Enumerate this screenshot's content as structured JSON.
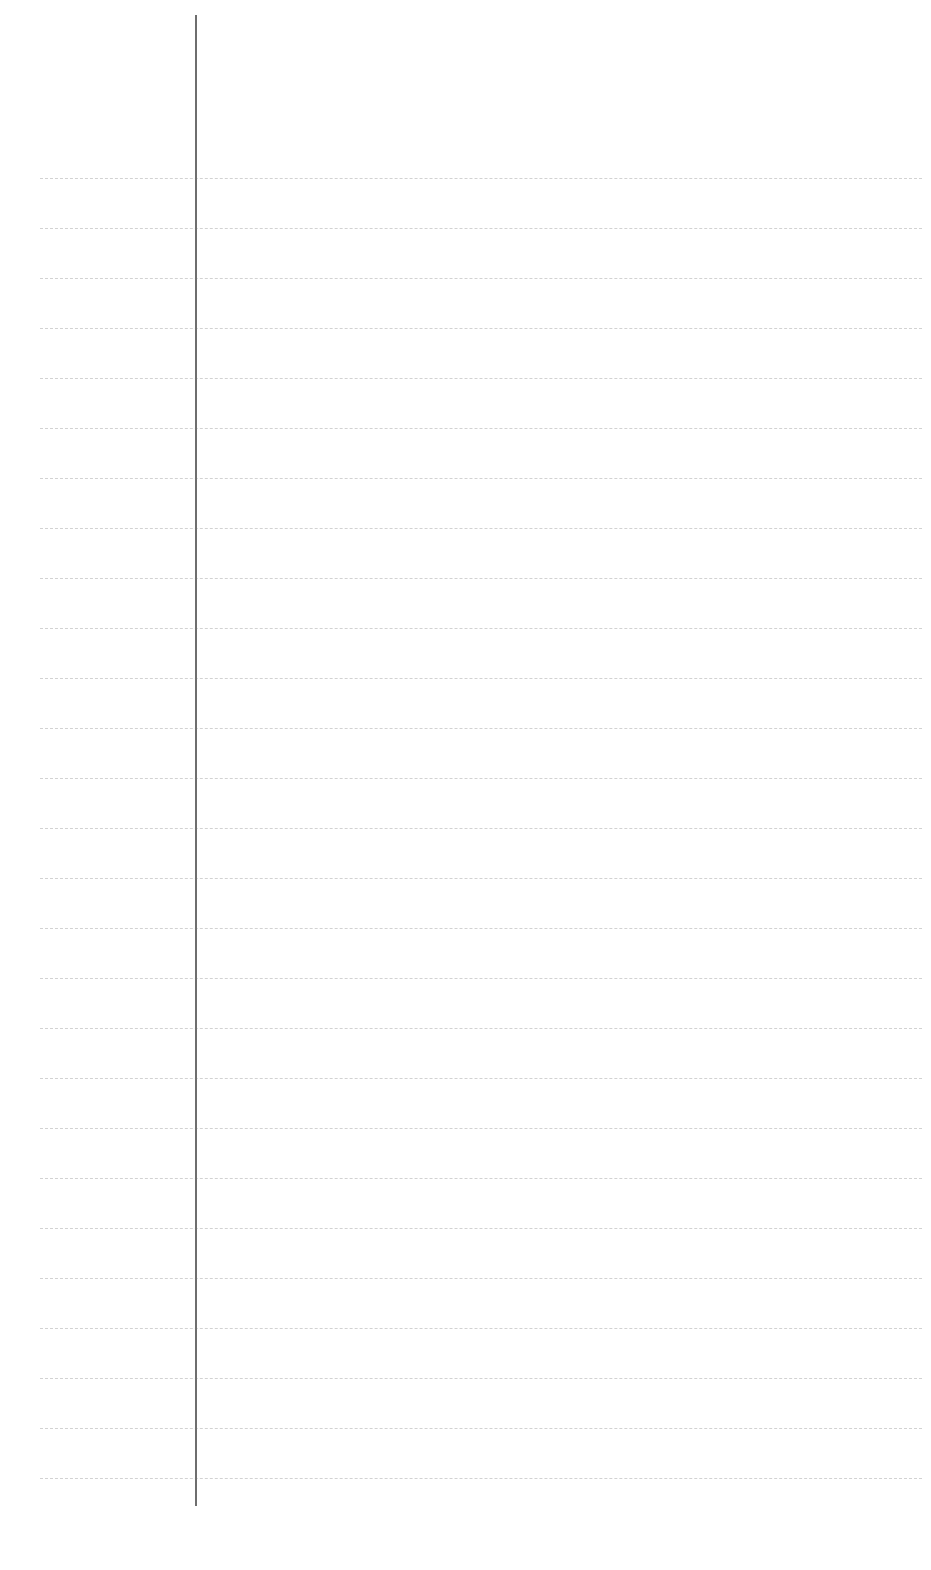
{
  "page": {
    "type": "ruled-paper",
    "background_color": "#ffffff",
    "rule_color": "#d2d2d2",
    "margin_line_color": "#6e6e6e",
    "rule_count": 27,
    "rule_start_y": 178,
    "rule_spacing": 50,
    "text": ""
  }
}
